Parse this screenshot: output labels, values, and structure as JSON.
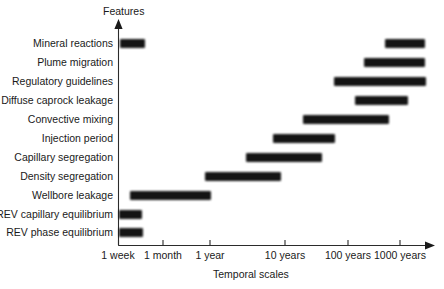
{
  "figure": {
    "y_axis_title": "Features",
    "x_axis_title": "Temporal scales"
  },
  "chart_data": {
    "type": "bar",
    "orientation": "horizontal",
    "title": "",
    "xlabel": "Temporal scales",
    "ylabel": "Features",
    "x_scale": "log-time",
    "grid": false,
    "legend": null,
    "x_tick_labels": [
      "1 week",
      "1 month",
      "1 year",
      "10 years",
      "100 years",
      "1000 years"
    ],
    "x_tick_positions_px": [
      118,
      163,
      210,
      285,
      348,
      400
    ],
    "categories": [
      "Mineral reactions",
      "Plume migration",
      "Regulatory guidelines",
      "Diffuse caprock leakage",
      "Convective mixing",
      "Injection period",
      "Capillary segregation",
      "Density segregation",
      "Wellbore leakage",
      "REV capillary equilibrium",
      "REV phase equilibrium"
    ],
    "bars": [
      {
        "category": "Mineral reactions",
        "segments": [
          {
            "start_label": "1 week",
            "end_label": "1 month",
            "start_px": 120,
            "end_px": 145
          },
          {
            "start_label": "100 years",
            "end_label": "1000 years",
            "start_px": 385,
            "end_px": 425
          }
        ]
      },
      {
        "category": "Plume migration",
        "segments": [
          {
            "start_label": "100 years",
            "end_label": "1000 years",
            "start_px": 364,
            "end_px": 425
          }
        ]
      },
      {
        "category": "Regulatory guidelines",
        "segments": [
          {
            "start_label": "10 years",
            "end_label": "1000 years",
            "start_px": 334,
            "end_px": 426
          }
        ]
      },
      {
        "category": "Diffuse caprock leakage",
        "segments": [
          {
            "start_label": "100 years",
            "end_label": "1000 years",
            "start_px": 355,
            "end_px": 408
          }
        ]
      },
      {
        "category": "Convective mixing",
        "segments": [
          {
            "start_label": "10 years",
            "end_label": "1000 years",
            "start_px": 303,
            "end_px": 389
          }
        ]
      },
      {
        "category": "Injection period",
        "segments": [
          {
            "start_label": "1 year",
            "end_label": "100 years",
            "start_px": 273,
            "end_px": 335
          }
        ]
      },
      {
        "category": "Capillary segregation",
        "segments": [
          {
            "start_label": "1 year",
            "end_label": "10 years",
            "start_px": 246,
            "end_px": 322
          }
        ]
      },
      {
        "category": "Density segregation",
        "segments": [
          {
            "start_label": "1 month",
            "end_label": "10 years",
            "start_px": 205,
            "end_px": 281
          }
        ]
      },
      {
        "category": "Wellbore leakage",
        "segments": [
          {
            "start_label": "1 week",
            "end_label": "1 month",
            "start_px": 130,
            "end_px": 211
          }
        ]
      },
      {
        "category": "REV capillary equilibrium",
        "segments": [
          {
            "start_label": "1 week",
            "end_label": "1 week",
            "start_px": 119,
            "end_px": 142
          }
        ]
      },
      {
        "category": "REV phase equilibrium",
        "segments": [
          {
            "start_label": "1 week",
            "end_label": "1 week",
            "start_px": 119,
            "end_px": 143
          }
        ]
      }
    ],
    "row_y_px": [
      43,
      62,
      81,
      100,
      119,
      138,
      157,
      176,
      195,
      214,
      232
    ],
    "colors": {
      "bar": "#0d0d0d",
      "axis": "#1a1a1a",
      "background": "#ffffff"
    }
  }
}
